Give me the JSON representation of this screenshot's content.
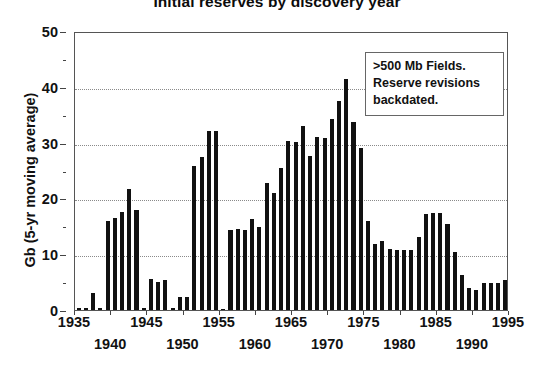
{
  "chart_data": {
    "type": "bar",
    "title": "Initial reserves by discovery year",
    "xlabel": "",
    "ylabel": "Gb (5-yr moving average)",
    "ylim": [
      0,
      50
    ],
    "xlim": [
      1935,
      1995
    ],
    "grid": true,
    "legend": null,
    "y_ticks": [
      0,
      10,
      20,
      30,
      40,
      50
    ],
    "y_tick_labels": [
      "0",
      "10",
      "20",
      "30",
      "40",
      "50"
    ],
    "x_ticks": [
      1935,
      1940,
      1945,
      1950,
      1955,
      1960,
      1965,
      1970,
      1975,
      1980,
      1985,
      1990,
      1995
    ],
    "x_tick_labels": [
      "1935",
      "1940",
      "1945",
      "1950",
      "1955",
      "1960",
      "1965",
      "1970",
      "1975",
      "1980",
      "1985",
      "1990",
      "1995"
    ],
    "bar_color": "#111111",
    "annotations": [
      ">500 Mb Fields.",
      "Reserve revisions",
      "backdated."
    ],
    "categories": [
      1935,
      1936,
      1937,
      1938,
      1939,
      1940,
      1941,
      1942,
      1943,
      1944,
      1945,
      1946,
      1947,
      1948,
      1949,
      1950,
      1951,
      1952,
      1953,
      1954,
      1955,
      1956,
      1957,
      1958,
      1959,
      1960,
      1961,
      1962,
      1963,
      1964,
      1965,
      1966,
      1967,
      1968,
      1969,
      1970,
      1971,
      1972,
      1973,
      1974,
      1975,
      1976,
      1977,
      1978,
      1979,
      1980,
      1981,
      1982,
      1983,
      1984,
      1985,
      1986,
      1987,
      1988,
      1989,
      1990,
      1991,
      1992,
      1993,
      1994
    ],
    "values": [
      0.4,
      0.4,
      3.1,
      0.3,
      16.0,
      16.5,
      17.5,
      21.7,
      18.0,
      0.3,
      5.5,
      5.1,
      5.3,
      0.3,
      2.3,
      2.3,
      25.8,
      27.5,
      32.0,
      32.0,
      0.2,
      14.3,
      14.5,
      14.3,
      16.4,
      14.8,
      22.7,
      21.0,
      25.5,
      30.3,
      30.1,
      33.0,
      27.6,
      31.0,
      30.8,
      34.2,
      37.5,
      41.4,
      33.7,
      29.0,
      16.0,
      11.8,
      12.3,
      11.0,
      10.8,
      10.7,
      10.8,
      13.0,
      17.2,
      17.3,
      17.3,
      15.5,
      10.4,
      6.2,
      4.0,
      3.6,
      4.8,
      4.9,
      4.9,
      5.3
    ]
  },
  "bars": [
    {
      "year": 1935,
      "value": 0.4
    },
    {
      "year": 1936,
      "value": 0.4
    },
    {
      "year": 1937,
      "value": 3.1
    },
    {
      "year": 1938,
      "value": 0.3
    },
    {
      "year": 1939,
      "value": 16.0
    },
    {
      "year": 1940,
      "value": 16.5
    },
    {
      "year": 1941,
      "value": 17.5
    },
    {
      "year": 1942,
      "value": 21.7
    },
    {
      "year": 1943,
      "value": 18.0
    },
    {
      "year": 1944,
      "value": 0.3
    },
    {
      "year": 1945,
      "value": 5.5
    },
    {
      "year": 1946,
      "value": 5.1
    },
    {
      "year": 1947,
      "value": 5.3
    },
    {
      "year": 1948,
      "value": 0.3
    },
    {
      "year": 1949,
      "value": 2.3
    },
    {
      "year": 1950,
      "value": 2.3
    },
    {
      "year": 1951,
      "value": 25.8
    },
    {
      "year": 1952,
      "value": 27.5
    },
    {
      "year": 1953,
      "value": 32.0
    },
    {
      "year": 1954,
      "value": 32.0
    },
    {
      "year": 1955,
      "value": 0.2
    },
    {
      "year": 1956,
      "value": 14.3
    },
    {
      "year": 1957,
      "value": 14.5
    },
    {
      "year": 1958,
      "value": 14.3
    },
    {
      "year": 1959,
      "value": 16.4
    },
    {
      "year": 1960,
      "value": 14.8
    },
    {
      "year": 1961,
      "value": 22.7
    },
    {
      "year": 1962,
      "value": 21.0
    },
    {
      "year": 1963,
      "value": 25.5
    },
    {
      "year": 1964,
      "value": 30.3
    },
    {
      "year": 1965,
      "value": 30.1
    },
    {
      "year": 1966,
      "value": 33.0
    },
    {
      "year": 1967,
      "value": 27.6
    },
    {
      "year": 1968,
      "value": 31.0
    },
    {
      "year": 1969,
      "value": 30.8
    },
    {
      "year": 1970,
      "value": 34.2
    },
    {
      "year": 1971,
      "value": 37.5
    },
    {
      "year": 1972,
      "value": 41.4
    },
    {
      "year": 1973,
      "value": 33.7
    },
    {
      "year": 1974,
      "value": 29.0
    },
    {
      "year": 1975,
      "value": 16.0
    },
    {
      "year": 1976,
      "value": 11.8
    },
    {
      "year": 1977,
      "value": 12.3
    },
    {
      "year": 1978,
      "value": 11.0
    },
    {
      "year": 1979,
      "value": 10.8
    },
    {
      "year": 1980,
      "value": 10.7
    },
    {
      "year": 1981,
      "value": 10.8
    },
    {
      "year": 1982,
      "value": 13.0
    },
    {
      "year": 1983,
      "value": 17.2
    },
    {
      "year": 1984,
      "value": 17.3
    },
    {
      "year": 1985,
      "value": 17.3
    },
    {
      "year": 1986,
      "value": 15.5
    },
    {
      "year": 1987,
      "value": 10.4
    },
    {
      "year": 1988,
      "value": 6.2
    },
    {
      "year": 1989,
      "value": 4.0
    },
    {
      "year": 1990,
      "value": 3.6
    },
    {
      "year": 1991,
      "value": 4.8
    },
    {
      "year": 1992,
      "value": 4.9
    },
    {
      "year": 1993,
      "value": 4.9
    },
    {
      "year": 1994,
      "value": 5.3
    }
  ],
  "annotation": {
    "line1": ">500 Mb Fields.",
    "line2": "Reserve revisions",
    "line3": "backdated."
  }
}
